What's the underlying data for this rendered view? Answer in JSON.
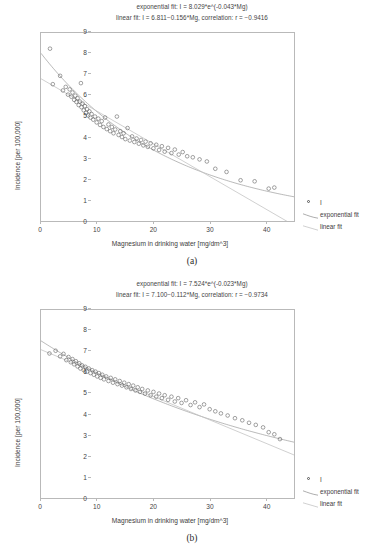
{
  "figures": [
    {
      "id": "a",
      "caption": "(a)",
      "titles": [
        "exponential fit: I = 8.029*e^(-0.043*Mg)",
        "linear fit: I = 6.811−0.156*Mg, correlation: r = −0.9416"
      ],
      "chart_data": {
        "type": "scatter",
        "title": "exponential fit: I = 8.029*e^(-0.043*Mg) / linear fit: I = 6.811−0.156*Mg, correlation: r = −0.9416",
        "xlabel": "Magnesium in drinking water [mg/dm^3]",
        "ylabel": "Incidence [per 100,000]",
        "xlim": [
          0,
          45
        ],
        "ylim": [
          0,
          9
        ],
        "xticks": [
          0,
          10,
          20,
          30,
          40
        ],
        "yticks": [
          0,
          1,
          2,
          3,
          4,
          5,
          6,
          7,
          8,
          9
        ],
        "grid": false,
        "legend_position": "right",
        "series": [
          {
            "name": "I",
            "type": "scatter",
            "marker": "open-circle",
            "points": [
              [
                1.6,
                8.25
              ],
              [
                2.1,
                6.55
              ],
              [
                3.4,
                6.95
              ],
              [
                3.9,
                6.25
              ],
              [
                4.4,
                6.42
              ],
              [
                4.8,
                6.05
              ],
              [
                5.1,
                6.3
              ],
              [
                5.4,
                5.95
              ],
              [
                5.6,
                6.15
              ],
              [
                5.9,
                5.8
              ],
              [
                6.1,
                6.0
              ],
              [
                6.3,
                5.7
              ],
              [
                6.5,
                5.88
              ],
              [
                6.7,
                5.55
              ],
              [
                6.9,
                5.72
              ],
              [
                7.1,
                6.6
              ],
              [
                7.2,
                5.45
              ],
              [
                7.4,
                5.62
              ],
              [
                7.6,
                5.3
              ],
              [
                7.8,
                5.5
              ],
              [
                8.0,
                5.18
              ],
              [
                8.2,
                5.35
              ],
              [
                8.4,
                5.05
              ],
              [
                8.6,
                5.25
              ],
              [
                8.8,
                4.95
              ],
              [
                9.0,
                5.12
              ],
              [
                9.3,
                4.85
              ],
              [
                9.6,
                5.0
              ],
              [
                9.9,
                4.72
              ],
              [
                10.2,
                4.9
              ],
              [
                10.5,
                4.6
              ],
              [
                10.8,
                4.78
              ],
              [
                11.1,
                4.5
              ],
              [
                11.4,
                4.95
              ],
              [
                11.7,
                4.4
              ],
              [
                12.0,
                4.62
              ],
              [
                12.3,
                4.3
              ],
              [
                12.6,
                4.5
              ],
              [
                12.9,
                4.2
              ],
              [
                13.2,
                4.38
              ],
              [
                13.5,
                5.0
              ],
              [
                13.8,
                4.12
              ],
              [
                14.1,
                4.3
              ],
              [
                14.4,
                4.02
              ],
              [
                14.7,
                4.2
              ],
              [
                15.0,
                3.92
              ],
              [
                15.4,
                4.45
              ],
              [
                15.8,
                3.85
              ],
              [
                16.2,
                4.05
              ],
              [
                16.6,
                3.78
              ],
              [
                17.0,
                3.95
              ],
              [
                17.4,
                3.7
              ],
              [
                17.8,
                3.88
              ],
              [
                18.2,
                3.62
              ],
              [
                18.6,
                3.8
              ],
              [
                19.0,
                3.55
              ],
              [
                19.5,
                3.72
              ],
              [
                20.0,
                3.48
              ],
              [
                20.5,
                3.65
              ],
              [
                21.0,
                3.4
              ],
              [
                21.5,
                3.58
              ],
              [
                22.0,
                3.32
              ],
              [
                22.6,
                3.5
              ],
              [
                23.2,
                3.25
              ],
              [
                23.8,
                3.42
              ],
              [
                24.5,
                3.18
              ],
              [
                25.2,
                3.3
              ],
              [
                26.0,
                3.1
              ],
              [
                27.0,
                3.05
              ],
              [
                28.2,
                2.95
              ],
              [
                29.5,
                2.85
              ],
              [
                31.0,
                2.5
              ],
              [
                33.0,
                2.35
              ],
              [
                35.5,
                1.95
              ],
              [
                38.0,
                1.9
              ],
              [
                40.5,
                1.55
              ],
              [
                41.5,
                1.6
              ]
            ]
          },
          {
            "name": "exponential fit",
            "type": "line",
            "equation": "I = 8.029*e^(-0.043*Mg)",
            "a": 8.029,
            "b": -0.043
          },
          {
            "name": "linear fit",
            "type": "line",
            "equation": "I = 6.811-0.156*Mg",
            "intercept": 6.811,
            "slope": -0.156,
            "correlation": -0.9416
          }
        ]
      }
    },
    {
      "id": "b",
      "caption": "(b)",
      "titles": [
        "exponential fit: I = 7.524*e^(-0.023*Mg)",
        "linear fit: I = 7.100−0.112*Mg, correlation: r = −0.9734"
      ],
      "chart_data": {
        "type": "scatter",
        "title": "exponential fit: I = 7.524*e^(-0.023*Mg) / linear fit: I = 7.100−0.112*Mg, correlation: r = −0.9734",
        "xlabel": "Magnesium in drinking water [mg/dm^3]",
        "ylabel": "Incidence [per 100,000]",
        "xlim": [
          0,
          45
        ],
        "ylim": [
          0,
          9
        ],
        "xticks": [
          0,
          10,
          20,
          30,
          40
        ],
        "yticks": [
          0,
          1,
          2,
          3,
          4,
          5,
          6,
          7,
          8,
          9
        ],
        "grid": false,
        "legend_position": "right",
        "series": [
          {
            "name": "I",
            "type": "scatter",
            "marker": "open-circle",
            "points": [
              [
                1.5,
                6.92
              ],
              [
                2.6,
                7.05
              ],
              [
                3.4,
                6.78
              ],
              [
                4.0,
                6.9
              ],
              [
                4.5,
                6.6
              ],
              [
                4.9,
                6.75
              ],
              [
                5.3,
                6.5
              ],
              [
                5.6,
                6.65
              ],
              [
                5.9,
                6.4
              ],
              [
                6.2,
                6.55
              ],
              [
                6.5,
                6.3
              ],
              [
                6.8,
                6.45
              ],
              [
                7.0,
                6.2
              ],
              [
                7.3,
                6.35
              ],
              [
                7.6,
                6.12
              ],
              [
                7.9,
                6.28
              ],
              [
                8.2,
                6.05
              ],
              [
                8.5,
                6.2
              ],
              [
                8.8,
                5.98
              ],
              [
                9.1,
                6.12
              ],
              [
                9.4,
                5.9
              ],
              [
                9.7,
                6.05
              ],
              [
                10.0,
                5.82
              ],
              [
                10.3,
                5.98
              ],
              [
                10.6,
                5.75
              ],
              [
                10.9,
                5.9
              ],
              [
                11.2,
                5.68
              ],
              [
                11.6,
                5.82
              ],
              [
                12.0,
                5.6
              ],
              [
                12.4,
                5.75
              ],
              [
                12.8,
                5.52
              ],
              [
                13.2,
                5.68
              ],
              [
                13.6,
                5.45
              ],
              [
                14.0,
                5.6
              ],
              [
                14.4,
                5.38
              ],
              [
                14.8,
                5.52
              ],
              [
                15.2,
                5.3
              ],
              [
                15.6,
                5.45
              ],
              [
                16.0,
                5.22
              ],
              [
                16.4,
                5.38
              ],
              [
                16.8,
                5.15
              ],
              [
                17.2,
                5.3
              ],
              [
                17.6,
                5.08
              ],
              [
                18.0,
                5.22
              ],
              [
                18.5,
                5.0
              ],
              [
                19.0,
                5.15
              ],
              [
                19.5,
                4.92
              ],
              [
                20.0,
                5.08
              ],
              [
                20.5,
                4.85
              ],
              [
                21.0,
                5.0
              ],
              [
                21.5,
                4.78
              ],
              [
                22.0,
                4.92
              ],
              [
                22.6,
                4.7
              ],
              [
                23.2,
                4.85
              ],
              [
                23.8,
                4.62
              ],
              [
                24.4,
                4.78
              ],
              [
                25.0,
                4.55
              ],
              [
                25.8,
                4.68
              ],
              [
                26.6,
                4.45
              ],
              [
                27.4,
                4.58
              ],
              [
                28.2,
                4.35
              ],
              [
                29.0,
                4.48
              ],
              [
                30.0,
                4.25
              ],
              [
                31.0,
                4.15
              ],
              [
                32.0,
                4.05
              ],
              [
                33.2,
                3.95
              ],
              [
                34.5,
                3.82
              ],
              [
                35.8,
                3.72
              ],
              [
                37.0,
                3.6
              ],
              [
                38.2,
                3.5
              ],
              [
                39.5,
                3.38
              ],
              [
                40.5,
                3.15
              ],
              [
                41.5,
                3.05
              ],
              [
                42.5,
                2.82
              ]
            ]
          },
          {
            "name": "exponential fit",
            "type": "line",
            "equation": "I = 7.524*e^(-0.023*Mg)",
            "a": 7.524,
            "b": -0.023
          },
          {
            "name": "linear fit",
            "type": "line",
            "equation": "I = 7.100-0.112*Mg",
            "intercept": 7.1,
            "slope": -0.112,
            "correlation": -0.9734
          }
        ]
      }
    }
  ],
  "axis": {
    "xlabel": "Magnesium in drinking water [mg/dm^3]",
    "ylabel": "Incidence [per 100,000]",
    "xticks": [
      "0",
      "10",
      "20",
      "30",
      "40"
    ],
    "yticks": [
      "9",
      "8",
      "7",
      "6",
      "5",
      "4",
      "3",
      "2",
      "1",
      "0"
    ]
  },
  "legend": {
    "items": [
      {
        "label": "I",
        "kind": "marker"
      },
      {
        "label": "exponential fit",
        "kind": "line"
      },
      {
        "label": "linear fit",
        "kind": "line"
      }
    ]
  },
  "colors": {
    "marker_stroke": "#555555",
    "exponential_line": "#8a8a8a",
    "linear_line": "#c4c4c4",
    "frame": "#b9b9b9",
    "text": "#3c3c3c"
  }
}
